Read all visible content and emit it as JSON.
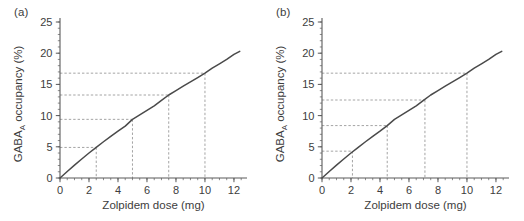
{
  "figure": {
    "panels": [
      {
        "label": "(a)"
      },
      {
        "label": "(b)"
      }
    ]
  },
  "axes": {
    "xlabel": "Zolpidem dose (mg)",
    "ylabel_main": "GABA",
    "ylabel_sub": "A",
    "ylabel_rest": " occupancy (%)",
    "x_ticks": [
      "0",
      "2",
      "4",
      "6",
      "8",
      "10",
      "12"
    ],
    "y_ticks": [
      "0",
      "5",
      "10",
      "15",
      "20",
      "25"
    ]
  },
  "colors": {
    "curve": "#4a4a4a",
    "axis": "#5a5a5a",
    "guide": "#9a9a9a",
    "text": "#3d3d3d",
    "background": "#ffffff"
  },
  "chart_data": [
    {
      "type": "line",
      "title": "(a)",
      "xlabel": "Zolpidem dose (mg)",
      "ylabel": "GABA_A occupancy (%)",
      "xlim": [
        0,
        12.9
      ],
      "ylim": [
        0,
        25
      ],
      "xticks": [
        0,
        2,
        4,
        6,
        8,
        10,
        12
      ],
      "yticks": [
        0,
        5,
        10,
        15,
        20,
        25
      ],
      "x_minor_step": 0.5,
      "y_minor_step": 1,
      "grid": false,
      "legend": "none",
      "series": [
        {
          "name": "GABA-A occupancy vs zolpidem dose",
          "x": [
            0,
            0.5,
            1,
            1.5,
            2,
            2.5,
            3,
            3.5,
            4,
            4.5,
            5,
            5.5,
            6,
            6.5,
            7,
            7.5,
            8,
            8.5,
            9,
            9.5,
            10,
            10.5,
            11,
            11.5,
            12,
            12.4
          ],
          "y": [
            0,
            1.05,
            2.07,
            3.05,
            4.0,
            4.92,
            5.81,
            6.67,
            7.5,
            8.31,
            9.4,
            10.1,
            10.83,
            11.55,
            12.43,
            13.3,
            14.0,
            14.71,
            15.4,
            16.1,
            16.8,
            17.6,
            18.3,
            19.0,
            19.8,
            20.3
          ]
        }
      ],
      "guides": [
        {
          "x": 2.5,
          "y": 4.9
        },
        {
          "x": 5.0,
          "y": 9.4
        },
        {
          "x": 7.5,
          "y": 13.3
        },
        {
          "x": 10.0,
          "y": 16.8
        }
      ]
    },
    {
      "type": "line",
      "title": "(b)",
      "xlabel": "Zolpidem dose (mg)",
      "ylabel": "GABA_A occupancy (%)",
      "xlim": [
        0,
        12.9
      ],
      "ylim": [
        0,
        25
      ],
      "xticks": [
        0,
        2,
        4,
        6,
        8,
        10,
        12
      ],
      "yticks": [
        0,
        5,
        10,
        15,
        20,
        25
      ],
      "x_minor_step": 0.5,
      "y_minor_step": 1,
      "grid": false,
      "legend": "none",
      "series": [
        {
          "name": "GABA-A occupancy vs zolpidem dose",
          "x": [
            0,
            0.5,
            1,
            1.5,
            2,
            2.5,
            3,
            3.5,
            4,
            4.5,
            5,
            5.5,
            6,
            6.5,
            7,
            7.5,
            8,
            8.5,
            9,
            9.5,
            10,
            10.5,
            11,
            11.5,
            12,
            12.4
          ],
          "y": [
            0,
            1.05,
            2.07,
            3.05,
            4.0,
            4.92,
            5.81,
            6.67,
            7.5,
            8.4,
            9.4,
            10.1,
            10.83,
            11.55,
            12.43,
            13.3,
            14.0,
            14.71,
            15.4,
            16.1,
            16.8,
            17.6,
            18.3,
            19.0,
            19.8,
            20.3
          ]
        }
      ],
      "guides": [
        {
          "x": 2.1,
          "y": 4.3
        },
        {
          "x": 4.5,
          "y": 8.4
        },
        {
          "x": 7.1,
          "y": 12.5
        },
        {
          "x": 10.0,
          "y": 16.8
        }
      ]
    }
  ]
}
